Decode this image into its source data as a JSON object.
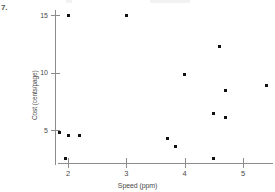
{
  "problem_number": "7.",
  "chart_data": {
    "type": "scatter",
    "title": "",
    "xlabel": "Speed (ppm)",
    "ylabel": "Cost (cents/page)",
    "xlim": [
      1.6,
      5.7
    ],
    "ylim": [
      1.6,
      15.9
    ],
    "xticks": [
      2,
      3,
      4,
      5
    ],
    "xtick_labels": [
      "2",
      "3",
      "4",
      "5"
    ],
    "yticks": [
      5,
      10,
      15
    ],
    "ytick_labels": [
      "5",
      "10",
      "15"
    ],
    "grid": false,
    "legend": null,
    "marker": "square",
    "marker_color": "#111111",
    "axis_color": "#8c8c8c",
    "points": [
      {
        "x": 2.0,
        "y": 15.0
      },
      {
        "x": 3.0,
        "y": 15.0
      },
      {
        "x": 4.6,
        "y": 12.3
      },
      {
        "x": 4.0,
        "y": 9.8
      },
      {
        "x": 5.4,
        "y": 8.9
      },
      {
        "x": 4.7,
        "y": 8.4
      },
      {
        "x": 4.5,
        "y": 6.4
      },
      {
        "x": 4.7,
        "y": 6.1
      },
      {
        "x": 1.85,
        "y": 4.8
      },
      {
        "x": 2.0,
        "y": 4.5
      },
      {
        "x": 2.2,
        "y": 4.5
      },
      {
        "x": 3.7,
        "y": 4.3
      },
      {
        "x": 3.85,
        "y": 3.6
      },
      {
        "x": 1.95,
        "y": 2.5
      },
      {
        "x": 4.5,
        "y": 2.5
      }
    ]
  }
}
